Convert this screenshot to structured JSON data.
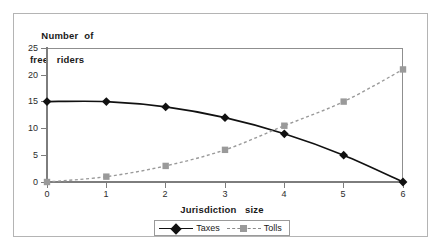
{
  "chart_data": {
    "type": "line",
    "title": "",
    "ylabel": "Number of free riders",
    "ylabel_line1": "Number  of",
    "ylabel_line2": "free   riders",
    "xlabel": "Jurisdiction   size",
    "x": [
      0,
      1,
      2,
      3,
      4,
      5,
      6
    ],
    "xtick_labels": [
      "0",
      "1",
      "2",
      "3",
      "4",
      "5",
      "6"
    ],
    "ytick_labels": [
      "0",
      "5",
      "10",
      "15",
      "20",
      "25"
    ],
    "ytick_values": [
      0,
      5,
      10,
      15,
      20,
      25
    ],
    "ylim": [
      0,
      25
    ],
    "xlim": [
      0,
      6
    ],
    "grid": false,
    "legend_position": "bottom-center",
    "series": [
      {
        "name": "Taxes",
        "values": [
          15,
          15,
          14,
          12,
          9,
          5,
          0
        ],
        "color": "#111111",
        "marker": "diamond",
        "linestyle": "solid"
      },
      {
        "name": "Tolls",
        "values": [
          0,
          1,
          3,
          6,
          10.5,
          15,
          21
        ],
        "color": "#9a9a9a",
        "marker": "square",
        "linestyle": "dotted"
      }
    ]
  },
  "legend": {
    "taxes_label": "Taxes",
    "tolls_label": "Tolls"
  },
  "colors": {
    "taxes": "#111111",
    "tolls": "#9a9a9a",
    "axis": "#7d7d7d",
    "frame": "#b4b4b4"
  }
}
